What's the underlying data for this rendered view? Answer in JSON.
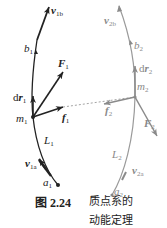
{
  "figure": {
    "number": "图 2.24",
    "title_line1": "质点系的",
    "title_line2": "动能定理"
  },
  "particle1": {
    "color": "#222222",
    "mass_label": "m",
    "mass_sub": "1",
    "start_label": "a",
    "start_sub": "1",
    "end_label": "b",
    "end_sub": "1",
    "path_label": "L",
    "path_sub": "1",
    "v_end_label": "v",
    "v_end_sub": "1b",
    "v_start_label": "v",
    "v_start_sub": "1a",
    "ext_force_label": "F",
    "ext_force_sub": "1",
    "int_force_label": "f",
    "int_force_sub": "1",
    "disp_label_d": "d",
    "disp_label": "r",
    "disp_sub": "1"
  },
  "particle2": {
    "color": "#8a8a8a",
    "mass_label": "m",
    "mass_sub": "2",
    "start_label": "a",
    "start_sub": "2",
    "end_label": "b",
    "end_sub": "2",
    "path_label": "L",
    "path_sub": "2",
    "v_end_label": "v",
    "v_end_sub": "2b",
    "v_start_label": "v",
    "v_start_sub": "2a",
    "ext_force_label": "F",
    "ext_force_sub": "2",
    "int_force_label": "f",
    "int_force_sub": "2",
    "disp_label_d": "d",
    "disp_label": "r",
    "disp_sub": "2"
  }
}
